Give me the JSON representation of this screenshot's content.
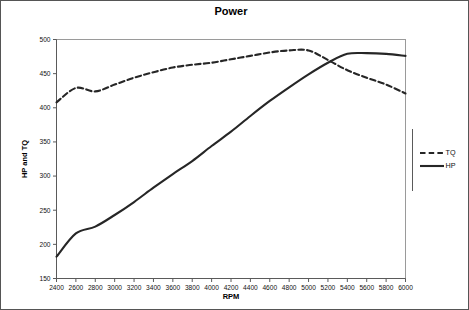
{
  "chart_data": {
    "type": "line",
    "title": "Power",
    "xlabel": "RPM",
    "ylabel": "HP and TQ",
    "x": [
      2400,
      2600,
      2800,
      3000,
      3200,
      3400,
      3600,
      3800,
      4000,
      4200,
      4400,
      4600,
      4800,
      5000,
      5200,
      5400,
      5600,
      5800,
      6000
    ],
    "xlim": [
      2400,
      6000
    ],
    "ylim": [
      150,
      500
    ],
    "xticks": [
      "2400",
      "2600",
      "2800",
      "3000",
      "3200",
      "3400",
      "3600",
      "3800",
      "4000",
      "4200",
      "4400",
      "4600",
      "4800",
      "5000",
      "5200",
      "5400",
      "5600",
      "5800",
      "6000"
    ],
    "yticks": [
      "150",
      "200",
      "250",
      "300",
      "350",
      "400",
      "450",
      "500"
    ],
    "grid": false,
    "legend_position": "right",
    "series": [
      {
        "name": "TQ",
        "style": "dashed",
        "color": "#262626",
        "values": [
          408,
          429,
          424,
          434,
          444,
          452,
          459,
          463,
          466,
          471,
          476,
          481,
          484,
          484,
          470,
          455,
          444,
          434,
          421
        ]
      },
      {
        "name": "HP",
        "style": "solid",
        "color": "#262626",
        "values": [
          182,
          216,
          226,
          243,
          262,
          283,
          303,
          322,
          344,
          365,
          388,
          410,
          430,
          449,
          466,
          479,
          480,
          479,
          476
        ]
      }
    ]
  },
  "legend": {
    "items": [
      {
        "label": "TQ"
      },
      {
        "label": "HP"
      }
    ]
  },
  "title": "Power"
}
